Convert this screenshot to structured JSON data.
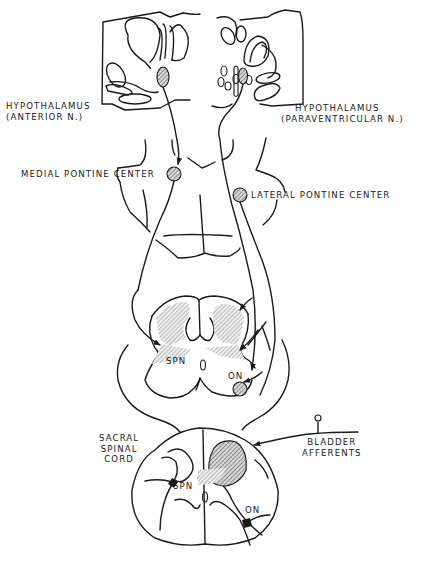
{
  "figure": {
    "type": "neuroanatomical-line-diagram",
    "colors": {
      "line": "#1a1a1a",
      "background": "#ffffff",
      "hatch": "#555555"
    }
  },
  "labels": {
    "hypothalamus_anterior": {
      "line1": "HYPOTHALAMUS",
      "line2": "(ANTERIOR N.)"
    },
    "hypothalamus_paraventricular": {
      "line1": "HYPOTHALAMUS",
      "line2": "(PARAVENTRICULAR N.)"
    },
    "medial_pontine_center": "MEDIAL PONTINE CENTER",
    "lateral_pontine_center": "LATERAL PONTINE CENTER",
    "upper_cord_spn": "SPN",
    "upper_cord_on": "ON",
    "sacral_cord": {
      "line1": "SACRAL",
      "line2": "SPINAL",
      "line3": "CORD"
    },
    "sacral_spn": "SPN",
    "sacral_on": "ON",
    "bladder_afferents": {
      "line1": "BLADDER",
      "line2": "AFFERENTS"
    }
  },
  "structures": [
    {
      "name": "anterior-hypothalamic-nucleus",
      "marker": "hatched-oval"
    },
    {
      "name": "paraventricular-nucleus",
      "marker": "hatched-oval"
    },
    {
      "name": "medial-pontine-center",
      "marker": "hatched-circle"
    },
    {
      "name": "lateral-pontine-center",
      "marker": "hatched-circle"
    },
    {
      "name": "onuf-nucleus-upper",
      "marker": "hatched-circle"
    },
    {
      "name": "sacral-spn",
      "marker": "black-cell"
    },
    {
      "name": "sacral-on",
      "marker": "black-cell"
    }
  ]
}
